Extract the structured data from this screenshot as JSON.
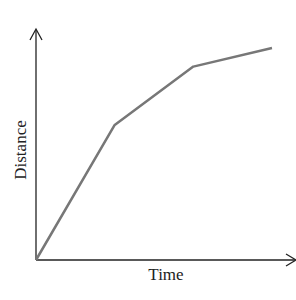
{
  "chart_data": {
    "type": "line",
    "title": "",
    "xlabel": "Time",
    "ylabel": "Distance",
    "grid": false,
    "legend": null,
    "ticks": "none",
    "series": [
      {
        "name": "distance-vs-time",
        "color": "#777777",
        "points": [
          [
            0,
            0
          ],
          [
            1,
            0.58
          ],
          [
            2,
            0.83
          ],
          [
            3,
            0.91
          ]
        ]
      }
    ],
    "x": [
      0,
      1,
      2,
      3
    ],
    "ylim": [
      0,
      1
    ],
    "xlim": [
      0,
      3.3
    ]
  },
  "labels": {
    "x": "Time",
    "y": "Distance"
  }
}
